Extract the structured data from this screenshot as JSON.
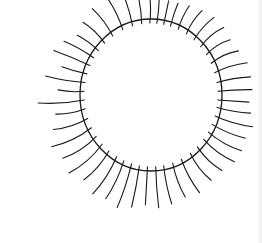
{
  "drawing": {
    "title": "Hand-drawn sun",
    "stroke_color": "#1a1a1a",
    "background": "#ffffff",
    "circle": {
      "cx": 151,
      "cy": 95,
      "rx": 71,
      "ry": 76,
      "stroke_width": 1.3
    },
    "rays": [
      {
        "angle": -125,
        "len": 30,
        "bend": 3
      },
      {
        "angle": -115,
        "len": 33,
        "bend": 3
      },
      {
        "angle": -106,
        "len": 33,
        "bend": 2
      },
      {
        "angle": -98,
        "len": 30,
        "bend": 2
      },
      {
        "angle": -91,
        "len": 27,
        "bend": 2
      },
      {
        "angle": -85,
        "len": 22,
        "bend": 1
      },
      {
        "angle": -79,
        "len": 20,
        "bend": 0
      },
      {
        "angle": -73,
        "len": 20,
        "bend": -1
      },
      {
        "angle": -66,
        "len": 22,
        "bend": -2
      },
      {
        "angle": -58,
        "len": 24,
        "bend": -3
      },
      {
        "angle": -50,
        "len": 26,
        "bend": -3
      },
      {
        "angle": -42,
        "len": 26,
        "bend": -4
      },
      {
        "angle": -34,
        "len": 24,
        "bend": -4
      },
      {
        "angle": -26,
        "len": 26,
        "bend": -4
      },
      {
        "angle": -18,
        "len": 30,
        "bend": -3
      },
      {
        "angle": -10,
        "len": 30,
        "bend": -2
      },
      {
        "angle": -3,
        "len": 30,
        "bend": -1
      },
      {
        "angle": 4,
        "len": 27,
        "bend": 0
      },
      {
        "angle": 10,
        "len": 30,
        "bend": 2
      },
      {
        "angle": 17,
        "len": 35,
        "bend": 3
      },
      {
        "angle": 24,
        "len": 32,
        "bend": 3
      },
      {
        "angle": 31,
        "len": 34,
        "bend": 4
      },
      {
        "angle": 38,
        "len": 34,
        "bend": 4
      },
      {
        "angle": 46,
        "len": 30,
        "bend": 4
      },
      {
        "angle": 54,
        "len": 30,
        "bend": 4
      },
      {
        "angle": 63,
        "len": 34,
        "bend": 3
      },
      {
        "angle": 71,
        "len": 32,
        "bend": 3
      },
      {
        "angle": 79,
        "len": 35,
        "bend": 2
      },
      {
        "angle": 86,
        "len": 37,
        "bend": 1
      },
      {
        "angle": 93,
        "len": 34,
        "bend": 0
      },
      {
        "angle": 100,
        "len": 38,
        "bend": -1
      },
      {
        "angle": 107,
        "len": 42,
        "bend": -2
      },
      {
        "angle": 114,
        "len": 38,
        "bend": -3
      },
      {
        "angle": 121,
        "len": 40,
        "bend": -4
      },
      {
        "angle": 129,
        "len": 34,
        "bend": -4
      },
      {
        "angle": 137,
        "len": 40,
        "bend": -5
      },
      {
        "angle": 145,
        "len": 36,
        "bend": -5
      },
      {
        "angle": 153,
        "len": 40,
        "bend": -5
      },
      {
        "angle": 161,
        "len": 32,
        "bend": -4
      },
      {
        "angle": 169,
        "len": 26,
        "bend": -3
      },
      {
        "angle": 176,
        "len": 42,
        "bend": -3
      },
      {
        "angle": -177,
        "len": 22,
        "bend": -2
      },
      {
        "angle": -170,
        "len": 36,
        "bend": -2
      },
      {
        "angle": -163,
        "len": 22,
        "bend": -1
      },
      {
        "angle": -156,
        "len": 35,
        "bend": 1
      },
      {
        "angle": -149,
        "len": 30,
        "bend": 2
      },
      {
        "angle": -142,
        "len": 22,
        "bend": 2
      },
      {
        "angle": -134,
        "len": 26,
        "bend": 3
      }
    ]
  }
}
